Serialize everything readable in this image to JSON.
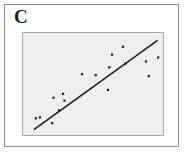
{
  "panel": {
    "label": "C",
    "border_color": "#8c8c8c",
    "background_color": "#ffffff"
  },
  "plot": {
    "background_color": "#eeeeee",
    "border_color": "#a8a8a8",
    "point_color": "#1c1c1c",
    "line_color": "#1c1c1c"
  },
  "chart_data": {
    "type": "scatter",
    "title": "C",
    "xlabel": "",
    "ylabel": "",
    "xlim": [
      0,
      100
    ],
    "ylim": [
      0,
      100
    ],
    "grid": false,
    "legend": null,
    "annotations": [
      "C"
    ],
    "marker": "square",
    "points": [
      {
        "x": 8,
        "y": 15
      },
      {
        "x": 11,
        "y": 16
      },
      {
        "x": 20,
        "y": 10
      },
      {
        "x": 21,
        "y": 36
      },
      {
        "x": 25,
        "y": 23
      },
      {
        "x": 28,
        "y": 40
      },
      {
        "x": 29,
        "y": 33
      },
      {
        "x": 42,
        "y": 60
      },
      {
        "x": 52,
        "y": 59
      },
      {
        "x": 61,
        "y": 44
      },
      {
        "x": 62,
        "y": 67
      },
      {
        "x": 64,
        "y": 80
      },
      {
        "x": 72,
        "y": 88
      },
      {
        "x": 74,
        "y": 71
      },
      {
        "x": 89,
        "y": 73
      },
      {
        "x": 91,
        "y": 58
      },
      {
        "x": 98,
        "y": 77
      }
    ],
    "trendline": {
      "type": "linear-fit",
      "x_start": 7,
      "y_start": 4,
      "x_end": 97,
      "y_end": 94
    }
  }
}
